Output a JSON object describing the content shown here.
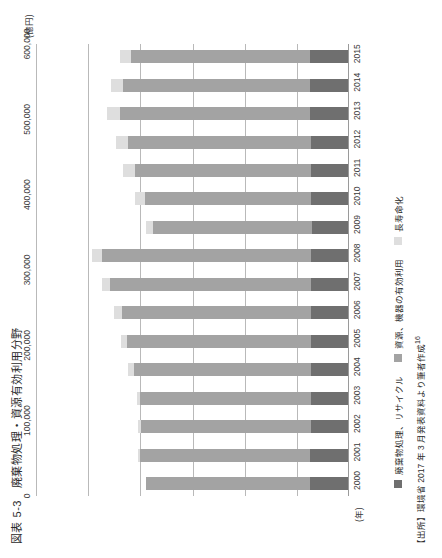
{
  "figure": {
    "number": "図表 5-3",
    "title": "廃棄物処理・資源有効利用分野",
    "source": "【出所】環境省 2017 年 3 月発表資料より筆者作成",
    "footnote_marker": "16"
  },
  "axis": {
    "y_unit": "(億円)",
    "x_unit": "(年)"
  },
  "chart_data": {
    "type": "bar",
    "subtype": "stacked",
    "xlabel": "(年)",
    "ylabel": "(億円)",
    "ylim": [
      0,
      600000
    ],
    "yticks": [
      0,
      100000,
      200000,
      300000,
      400000,
      500000,
      600000
    ],
    "ytick_labels": [
      "0",
      "100,000",
      "200,000",
      "300,000",
      "400,000",
      "500,000",
      "600,000"
    ],
    "grid": true,
    "legend_position": "bottom",
    "categories": [
      "2000",
      "2001",
      "2002",
      "2003",
      "2004",
      "2005",
      "2006",
      "2007",
      "2008",
      "2009",
      "2010",
      "2011",
      "2012",
      "2013",
      "2014",
      "2015"
    ],
    "series": [
      {
        "name": "廃棄物処理、リサイクル",
        "color": "#6f6f6f",
        "values": [
          72000,
          72000,
          71000,
          71000,
          71000,
          71000,
          71000,
          71000,
          71000,
          69000,
          70000,
          71000,
          71000,
          72000,
          72000,
          72000
        ]
      },
      {
        "name": "資源、機器の有効利用",
        "color": "#a3a3a3",
        "values": [
          316000,
          327000,
          326000,
          327000,
          339000,
          352000,
          363000,
          385000,
          400000,
          304000,
          320000,
          338000,
          350000,
          366000,
          360000,
          344000
        ]
      },
      {
        "name": "長寿命化",
        "color": "#dedede",
        "values": [
          0,
          4000,
          5000,
          6000,
          12000,
          13000,
          14000,
          16000,
          19000,
          14000,
          18000,
          22000,
          23000,
          25000,
          23000,
          22000
        ]
      }
    ],
    "totals": [
      388000,
      403000,
      402000,
      404000,
      422000,
      436000,
      448000,
      472000,
      490000,
      387000,
      408000,
      431000,
      444000,
      463000,
      455000,
      438000
    ]
  },
  "legend": [
    {
      "label": "廃棄物処理、リサイクル",
      "color": "#6f6f6f"
    },
    {
      "label": "資源、機器の有効利用",
      "color": "#a3a3a3"
    },
    {
      "label": "長寿命化",
      "color": "#dedede"
    }
  ]
}
